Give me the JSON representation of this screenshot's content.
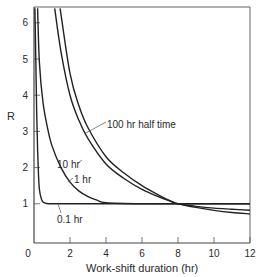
{
  "chart_data": {
    "type": "line",
    "title": "",
    "xlabel": "Work-shift duration (hr)",
    "ylabel": "R",
    "xlim": [
      0,
      12
    ],
    "ylim": [
      0,
      6.4
    ],
    "x_ticks": [
      0,
      2,
      4,
      6,
      8,
      10,
      12
    ],
    "y_ticks": [
      1,
      2,
      3,
      4,
      5,
      6
    ],
    "grid": false,
    "legend": "none (curves labeled directly)",
    "series": [
      {
        "name": "0.1 hr",
        "label": "0.1 hr",
        "x": [
          0.05,
          0.1,
          0.15,
          0.2,
          0.25,
          0.3,
          0.4,
          0.5,
          0.7,
          1.0,
          2.0,
          4.0,
          8.0,
          12.0
        ],
        "y": [
          6.4,
          5.0,
          3.5,
          2.5,
          1.8,
          1.4,
          1.15,
          1.05,
          1.01,
          1.0,
          1.0,
          1.0,
          1.0,
          1.0
        ]
      },
      {
        "name": "1 hr",
        "label": "1 hr",
        "x": [
          0.2,
          0.3,
          0.5,
          0.75,
          1.0,
          1.5,
          2.0,
          2.5,
          3.0,
          3.5,
          4.0,
          6.0,
          8.0,
          12.0
        ],
        "y": [
          6.4,
          4.9,
          3.8,
          3.1,
          2.6,
          2.0,
          1.6,
          1.35,
          1.2,
          1.1,
          1.03,
          1.0,
          1.0,
          1.0
        ]
      },
      {
        "name": "10 hr",
        "label": "10 hr",
        "x": [
          1.15,
          1.5,
          2.0,
          2.5,
          3.0,
          4.0,
          5.0,
          6.0,
          7.0,
          7.7,
          8.0,
          9.0,
          10.0,
          11.0,
          12.0
        ],
        "y": [
          6.4,
          5.2,
          4.0,
          3.3,
          2.8,
          2.1,
          1.7,
          1.4,
          1.18,
          1.05,
          1.0,
          0.93,
          0.88,
          0.85,
          0.82
        ]
      },
      {
        "name": "100 hr half time",
        "label": "100 hr half time",
        "x": [
          1.45,
          2.0,
          2.5,
          3.0,
          4.0,
          5.0,
          6.0,
          7.0,
          7.7,
          8.0,
          9.0,
          10.0,
          11.0,
          12.0
        ],
        "y": [
          6.4,
          4.6,
          3.7,
          3.1,
          2.3,
          1.85,
          1.5,
          1.22,
          1.05,
          1.0,
          0.9,
          0.82,
          0.76,
          0.72
        ]
      }
    ],
    "annotations": [
      {
        "text": "100 hr half time",
        "points_to": "100 hr half time curve near x=3.8"
      },
      {
        "text": "10 hr",
        "points_to": "10 hr curve near x=2.3"
      },
      {
        "text": "1 hr",
        "points_to": "1 hr curve near x=1.9"
      },
      {
        "text": "0.1 hr",
        "points_to": "0.1 hr curve near x=1.3"
      }
    ]
  },
  "labels": {
    "x_title": "Work-shift duration (hr)",
    "y_title": "R",
    "x_ticks": [
      "0",
      "2",
      "4",
      "6",
      "8",
      "10",
      "12"
    ],
    "y_ticks": [
      "1",
      "2",
      "3",
      "4",
      "5",
      "6"
    ],
    "curve_100": "100 hr half time",
    "curve_10": "10 hr",
    "curve_1": "1 hr",
    "curve_01": "0.1 hr"
  },
  "colors": {
    "line": "#222222",
    "axis": "#444444",
    "text": "#2a2a2a",
    "background": "#ffffff"
  }
}
